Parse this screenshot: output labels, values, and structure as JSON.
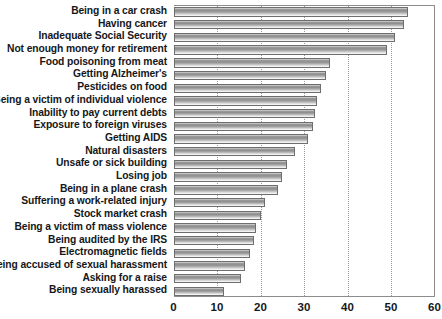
{
  "chart_data": {
    "type": "bar",
    "orientation": "horizontal",
    "title": "",
    "subtitle": "",
    "xlabel": "",
    "ylabel": "",
    "xlim": [
      0,
      60
    ],
    "ylim": null,
    "grid": true,
    "grid_axis": "x",
    "legend": null,
    "legend_position": "none",
    "xticks": [
      0,
      10,
      20,
      30,
      40,
      50,
      60
    ],
    "xtick_labels": [
      "0",
      "10",
      "20",
      "30",
      "40",
      "50",
      "60"
    ],
    "categories": [
      "Being in a car crash",
      "Having cancer",
      "Inadequate Social Security",
      "Not enough money for retirement",
      "Food poisoning from meat",
      "Getting Alzheimer's",
      "Pesticides on food",
      "Being a victim of individual violence",
      "Inability to pay current debts",
      "Exposure to foreign viruses",
      "Getting AIDS",
      "Natural disasters",
      "Unsafe or sick building",
      "Losing job",
      "Being in a plane crash",
      "Suffering a work-related injury",
      "Stock market crash",
      "Being a victim of mass violence",
      "Being audited by the IRS",
      "Electromagnetic fields",
      "Being accused of sexual harassment",
      "Asking for a raise",
      "Being sexually harassed"
    ],
    "values": [
      54,
      53,
      51,
      49,
      36,
      35,
      34,
      33,
      32.5,
      32,
      31,
      28,
      26,
      25,
      24,
      21,
      20,
      19,
      18.5,
      17.5,
      16.5,
      15.5,
      11.5
    ],
    "series": [
      {
        "name": "Percent concerned",
        "values": [
          54,
          53,
          51,
          49,
          36,
          35,
          34,
          33,
          32.5,
          32,
          31,
          28,
          26,
          25,
          24,
          21,
          20,
          19,
          18.5,
          17.5,
          16.5,
          15.5,
          11.5
        ]
      }
    ],
    "bar_fill_top": "#9d9d9d",
    "bar_fill_bottom": "#f6f6f6",
    "bar_border": "#6e6e6e",
    "grid_color": "#9a9a9a",
    "frame_color": "#8c8c8c",
    "text_color": "#15171a"
  }
}
